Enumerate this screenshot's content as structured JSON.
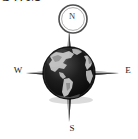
{
  "image": {
    "kind": "compass-rose-globe-icon",
    "width": 138,
    "height": 139,
    "background_color": "#ffffff"
  },
  "top_text": {
    "clipped_caption": "SWM",
    "note_visible": "bottom sliver of bold text clipped by the top edge"
  },
  "compass": {
    "directions": [
      {
        "key": "north",
        "label": "N",
        "angle_deg": 0
      },
      {
        "key": "east",
        "label": "E",
        "angle_deg": 90
      },
      {
        "key": "south",
        "label": "S",
        "angle_deg": 180
      },
      {
        "key": "west",
        "label": "W",
        "angle_deg": 270
      }
    ],
    "needle_color": "#6e6e6e",
    "needle_shadow_color": "#3d3d3d",
    "north_ring": {
      "name": "north-bezel-ring",
      "center_x": 73,
      "center_y": 19,
      "radius": 14,
      "stroke_color": "#555555"
    },
    "center_x": 69,
    "center_y": 73
  },
  "globe": {
    "name": "earth-globe",
    "center_x": 69,
    "center_y": 73,
    "radius": 26,
    "ocean_color": "#111111",
    "land_color": "#b8b8b8",
    "land_shadow_color": "#8f8f8f",
    "rim_color": "#2a2a2a",
    "highlight_color": "#4a4a4a",
    "continents_shown": "Americas, west Africa, Europe edge"
  },
  "colors": {
    "ink": "#1a1a1a",
    "metal_light": "#9a9a9a",
    "metal_mid": "#6e6e6e",
    "metal_dark": "#3d3d3d",
    "white": "#ffffff"
  }
}
